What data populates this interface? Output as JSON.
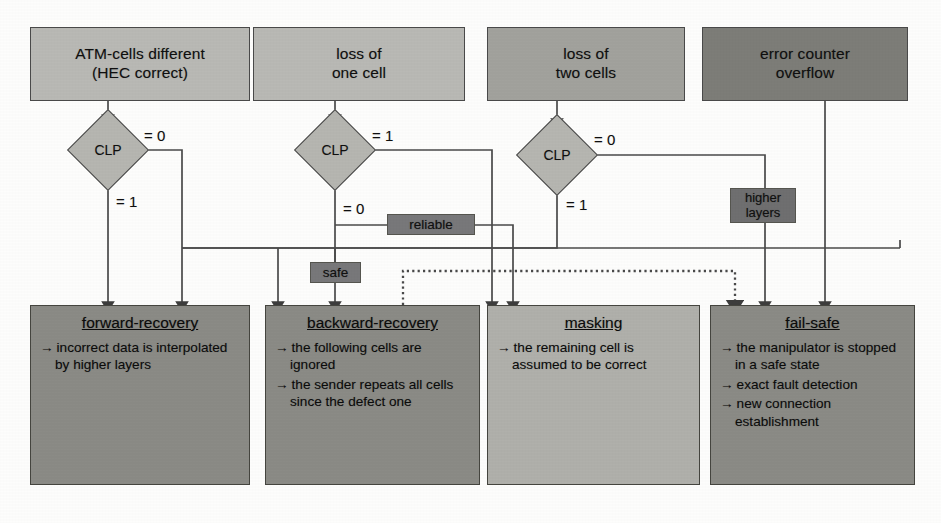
{
  "diagram": {
    "colors": {
      "fill_light": "#b9b9b5",
      "fill_mid": "#a2a29d",
      "fill_dark": "#8a8a85",
      "fill_darker": "#7d7d78",
      "tag_fill": "#78787a",
      "line": "#4a4a4a",
      "text": "#101010",
      "background": "#fdfdfc"
    },
    "events": [
      {
        "id": "atm-cells-different",
        "lines": [
          "ATM-cells different",
          "(HEC correct)"
        ],
        "shade": "light"
      },
      {
        "id": "loss-of-one-cell",
        "lines": [
          "loss of",
          "one cell"
        ],
        "shade": "light"
      },
      {
        "id": "loss-of-two-cells",
        "lines": [
          "loss of",
          "two cells"
        ],
        "shade": "mid"
      },
      {
        "id": "error-counter-overflow",
        "lines": [
          "error counter",
          "overflow"
        ],
        "shade": "darker"
      }
    ],
    "decisions": [
      {
        "id": "clp-1",
        "label": "CLP",
        "right_label": "= 0",
        "down_label": "= 1"
      },
      {
        "id": "clp-2",
        "label": "CLP",
        "right_label": "= 1",
        "down_label": "= 0"
      },
      {
        "id": "clp-3",
        "label": "CLP",
        "right_label": "= 0",
        "down_label": "= 1"
      }
    ],
    "tags": [
      {
        "id": "reliable",
        "label": "reliable"
      },
      {
        "id": "safe",
        "label": "safe"
      },
      {
        "id": "higher-layers",
        "lines": [
          "higher",
          "layers"
        ]
      }
    ],
    "results": [
      {
        "id": "forward-recovery",
        "title": "forward-recovery",
        "shade": "dark",
        "bullets": [
          "incorrect data is interpolated by higher layers"
        ]
      },
      {
        "id": "backward-recovery",
        "title": "backward-recovery",
        "shade": "dark",
        "bullets": [
          "the following cells are ignored",
          "the sender repeats all cells since the defect one"
        ]
      },
      {
        "id": "masking",
        "title": "masking",
        "shade": "light",
        "bullets": [
          "the remaining cell is assumed to be correct"
        ]
      },
      {
        "id": "fail-safe",
        "title": "fail-safe",
        "shade": "dark",
        "bullets": [
          "the manipulator is stopped in a safe state",
          "exact fault detection",
          "new connection establishment"
        ]
      }
    ],
    "bullet_arrow": "→"
  }
}
